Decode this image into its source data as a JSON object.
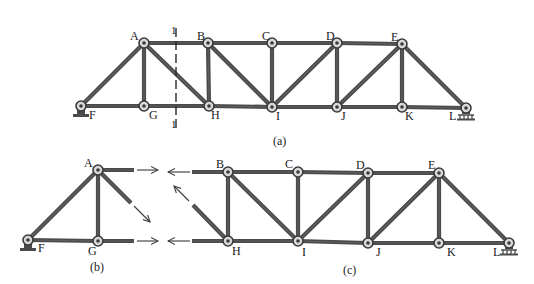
{
  "colors": {
    "background": "#ffffff",
    "member": "#4a4a4a",
    "member_highlight": "#6e6e6e",
    "node_ring": "#3a3a3a",
    "node_fill": "#d8d8d8",
    "text": "#1a1a1a"
  },
  "figure_a": {
    "caption": "(a)",
    "caption_pos": [
      273,
      145
    ],
    "nodes": [
      {
        "id": "A",
        "x": 144,
        "y": 43,
        "label": "A",
        "lx": 130,
        "ly": 40
      },
      {
        "id": "B",
        "x": 208,
        "y": 43,
        "label": "B",
        "lx": 197,
        "ly": 40
      },
      {
        "id": "C",
        "x": 272,
        "y": 43,
        "label": "C",
        "lx": 262,
        "ly": 40
      },
      {
        "id": "D",
        "x": 337,
        "y": 43,
        "label": "D",
        "lx": 326,
        "ly": 40
      },
      {
        "id": "E",
        "x": 402,
        "y": 44,
        "label": "E",
        "lx": 391,
        "ly": 41
      },
      {
        "id": "F",
        "x": 81,
        "y": 106,
        "label": "F",
        "lx": 89,
        "ly": 119
      },
      {
        "id": "G",
        "x": 144,
        "y": 106,
        "label": "G",
        "lx": 149,
        "ly": 119
      },
      {
        "id": "H",
        "x": 209,
        "y": 106,
        "label": "H",
        "lx": 211,
        "ly": 119
      },
      {
        "id": "I",
        "x": 272,
        "y": 107,
        "label": "I",
        "lx": 276,
        "ly": 120
      },
      {
        "id": "J",
        "x": 337,
        "y": 107,
        "label": "J",
        "lx": 341,
        "ly": 120
      },
      {
        "id": "K",
        "x": 402,
        "y": 107,
        "label": "K",
        "lx": 405,
        "ly": 120
      },
      {
        "id": "L",
        "x": 466,
        "y": 108,
        "label": "L",
        "lx": 449,
        "ly": 120
      }
    ],
    "members": [
      [
        "F",
        "A"
      ],
      [
        "A",
        "G"
      ],
      [
        "A",
        "H"
      ],
      [
        "F",
        "G"
      ],
      [
        "G",
        "H"
      ],
      [
        "A",
        "B"
      ],
      [
        "B",
        "H"
      ],
      [
        "B",
        "I"
      ],
      [
        "B",
        "C"
      ],
      [
        "C",
        "I"
      ],
      [
        "H",
        "I"
      ],
      [
        "C",
        "D"
      ],
      [
        "I",
        "D"
      ],
      [
        "D",
        "J"
      ],
      [
        "I",
        "J"
      ],
      [
        "D",
        "E"
      ],
      [
        "J",
        "E"
      ],
      [
        "E",
        "K"
      ],
      [
        "J",
        "K"
      ],
      [
        "K",
        "L"
      ],
      [
        "E",
        "L"
      ]
    ],
    "supports": [
      {
        "type": "pin",
        "node": "F"
      },
      {
        "type": "roller",
        "node": "L"
      }
    ],
    "section_cut": {
      "x": 176,
      "y1": 28,
      "y2": 128,
      "label_top": "1",
      "label_top_pos": [
        171,
        34
      ],
      "label_bottom": "1",
      "label_bottom_pos": [
        171,
        128
      ]
    }
  },
  "figure_b": {
    "caption": "(b)",
    "caption_pos": [
      90,
      271
    ],
    "nodes": [
      {
        "id": "A",
        "x": 98,
        "y": 170,
        "label": "A",
        "lx": 84,
        "ly": 167
      },
      {
        "id": "F",
        "x": 28,
        "y": 240,
        "label": "F",
        "lx": 38,
        "ly": 252
      },
      {
        "id": "G",
        "x": 98,
        "y": 241,
        "label": "G",
        "lx": 88,
        "ly": 255
      }
    ],
    "members": [
      [
        "F",
        "A"
      ],
      [
        "A",
        "G"
      ],
      [
        "F",
        "G"
      ]
    ],
    "stubs": [
      {
        "from": [
          98,
          170
        ],
        "to": [
          134,
          170
        ]
      },
      {
        "from": [
          98,
          170
        ],
        "to": [
          131,
          203
        ]
      },
      {
        "from": [
          98,
          241
        ],
        "to": [
          134,
          241
        ]
      }
    ],
    "arrows": [
      {
        "from": [
          137,
          170
        ],
        "to": [
          158,
          170
        ]
      },
      {
        "from": [
          134,
          206
        ],
        "to": [
          150,
          222
        ]
      },
      {
        "from": [
          137,
          241
        ],
        "to": [
          158,
          241
        ]
      }
    ],
    "supports": [
      {
        "type": "pin",
        "node": "F"
      }
    ]
  },
  "figure_c": {
    "caption": "(c)",
    "caption_pos": [
      343,
      274
    ],
    "nodes": [
      {
        "id": "B",
        "x": 228,
        "y": 172,
        "label": "B",
        "lx": 216,
        "ly": 168
      },
      {
        "id": "C",
        "x": 298,
        "y": 172,
        "label": "C",
        "lx": 285,
        "ly": 168
      },
      {
        "id": "D",
        "x": 368,
        "y": 173,
        "label": "D",
        "lx": 356,
        "ly": 169
      },
      {
        "id": "E",
        "x": 439,
        "y": 173,
        "label": "E",
        "lx": 428,
        "ly": 169
      },
      {
        "id": "H",
        "x": 228,
        "y": 241,
        "label": "H",
        "lx": 232,
        "ly": 255
      },
      {
        "id": "I",
        "x": 298,
        "y": 241,
        "label": "I",
        "lx": 302,
        "ly": 256
      },
      {
        "id": "J",
        "x": 368,
        "y": 243,
        "label": "J",
        "lx": 376,
        "ly": 256
      },
      {
        "id": "K",
        "x": 439,
        "y": 243,
        "label": "K",
        "lx": 447,
        "ly": 256
      },
      {
        "id": "L",
        "x": 509,
        "y": 243,
        "label": "L",
        "lx": 493,
        "ly": 256
      }
    ],
    "members": [
      [
        "B",
        "H"
      ],
      [
        "B",
        "I"
      ],
      [
        "B",
        "C"
      ],
      [
        "C",
        "I"
      ],
      [
        "H",
        "I"
      ],
      [
        "C",
        "D"
      ],
      [
        "I",
        "D"
      ],
      [
        "D",
        "J"
      ],
      [
        "I",
        "J"
      ],
      [
        "D",
        "E"
      ],
      [
        "J",
        "E"
      ],
      [
        "E",
        "K"
      ],
      [
        "J",
        "K"
      ],
      [
        "K",
        "L"
      ],
      [
        "E",
        "L"
      ]
    ],
    "stubs": [
      {
        "from": [
          228,
          172
        ],
        "to": [
          192,
          172
        ]
      },
      {
        "from": [
          228,
          241
        ],
        "to": [
          193,
          205
        ]
      },
      {
        "from": [
          228,
          241
        ],
        "to": [
          192,
          241
        ]
      }
    ],
    "arrows": [
      {
        "from": [
          190,
          172
        ],
        "to": [
          168,
          172
        ]
      },
      {
        "from": [
          189,
          201
        ],
        "to": [
          174,
          186
        ]
      },
      {
        "from": [
          190,
          241
        ],
        "to": [
          168,
          241
        ]
      }
    ],
    "supports": [
      {
        "type": "roller",
        "node": "L"
      }
    ]
  }
}
